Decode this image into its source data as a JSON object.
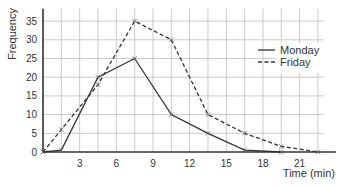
{
  "chart_data": {
    "type": "line",
    "title": "",
    "xlabel": "Time (min)",
    "ylabel": "Frequency",
    "xlim": [
      0,
      24
    ],
    "ylim": [
      0,
      38
    ],
    "x_ticks": [
      0,
      3,
      6,
      9,
      12,
      15,
      18,
      21
    ],
    "y_ticks": [
      0,
      5,
      10,
      15,
      20,
      25,
      30,
      35
    ],
    "grid": true,
    "grid_x_step": 1.5,
    "grid_y_step": 5,
    "legend_position": "upper right",
    "series": [
      {
        "name": "Monday",
        "style": "solid",
        "color": "#333333",
        "x": [
          0,
          1.5,
          4.5,
          7.5,
          10.5,
          13.5,
          16.5,
          19.5
        ],
        "y": [
          0,
          0.5,
          20,
          25,
          10,
          5,
          0.5,
          0
        ]
      },
      {
        "name": "Friday",
        "style": "dashed",
        "color": "#333333",
        "x": [
          0,
          1.5,
          4.5,
          7.5,
          10.5,
          13.5,
          16.5,
          19.5,
          22.5
        ],
        "y": [
          0,
          6,
          18,
          35,
          30,
          10,
          5,
          1.5,
          0
        ]
      }
    ]
  }
}
